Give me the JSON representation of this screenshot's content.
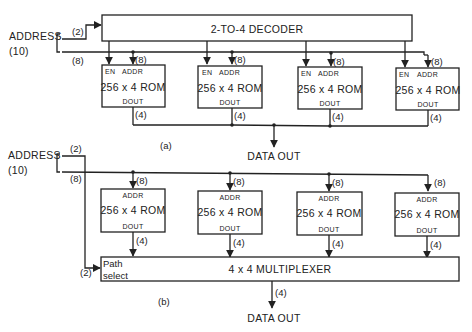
{
  "page_number": "118",
  "part_a": {
    "caption": "(a)",
    "address_label": "ADDRESS",
    "address_width": "(10)",
    "select_width": "(2)",
    "addr_bus_width": "(8)",
    "decoder_label": "2-TO-4 DECODER",
    "roms": [
      {
        "en": "EN",
        "addr": "ADDR",
        "label": "256 x 4 ROM",
        "dout": "DOUT",
        "addr_width": "(8)",
        "out_width": "(4)"
      },
      {
        "en": "EN",
        "addr": "ADDR",
        "label": "256 x 4 ROM",
        "dout": "DOUT",
        "addr_width": "(8)",
        "out_width": "(4)"
      },
      {
        "en": "EN",
        "addr": "ADDR",
        "label": "256 x 4 ROM",
        "dout": "DOUT",
        "addr_width": "(8)",
        "out_width": "(4)"
      },
      {
        "en": "EN",
        "addr": "ADDR",
        "label": "256 x 4 ROM",
        "dout": "DOUT",
        "addr_width": "(8)",
        "out_width": "(4)"
      }
    ],
    "output_label": "DATA OUT"
  },
  "part_b": {
    "caption": "(b)",
    "address_label": "ADDRESS",
    "address_width": "(10)",
    "select_width_top": "(2)",
    "select_width_bottom": "(2)",
    "addr_bus_width": "(8)",
    "roms": [
      {
        "addr": "ADDR",
        "label": "256 x 4 ROM",
        "dout": "DOUT",
        "addr_width": "(8)",
        "out_width": "(4)"
      },
      {
        "addr": "ADDR",
        "label": "256 x 4 ROM",
        "dout": "DOUT",
        "addr_width": "(8)",
        "out_width": "(4)"
      },
      {
        "addr": "ADDR",
        "label": "256 x 4 ROM",
        "dout": "DOUT",
        "addr_width": "(8)",
        "out_width": "(4)"
      },
      {
        "addr": "ADDR",
        "label": "256 x 4 ROM",
        "dout": "DOUT",
        "addr_width": "(8)",
        "out_width": "(4)"
      }
    ],
    "mux_label": "4 x 4 MULTIPLEXER",
    "path_select_line1": "Path",
    "path_select_line2": "select",
    "out_width": "(4)",
    "output_label": "DATA OUT"
  }
}
